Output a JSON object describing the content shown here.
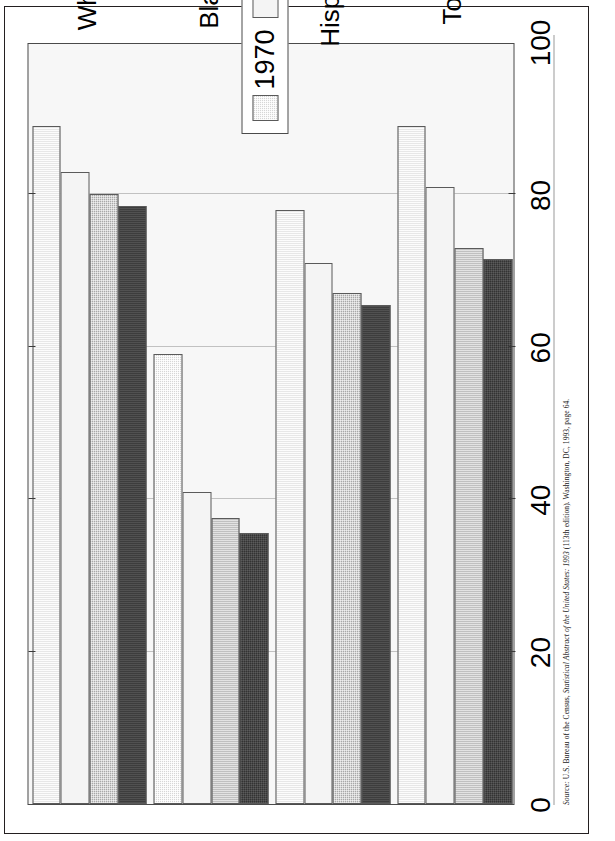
{
  "document": {
    "orientation": "rotated-90-ccw",
    "background_color": "#ffffff",
    "frame_color": "#231f20"
  },
  "caption": {
    "source_label": "Source:",
    "text": "U.S. Bureau of the Census, Statistical Abstract of the United States: 1993 (113th edition). Washington, DC, 1993, page 64.",
    "italic_part": "Statistical Abstract of the United States: 1993",
    "plain_head": "U.S. Bureau of the Census, ",
    "plain_tail": " (113th edition). Washington, DC, 1993, page 64."
  },
  "legend": {
    "position": "top-left-inside-plot",
    "entries": [
      {
        "label": "1970",
        "color": "#d6d6d6",
        "swatch": "stipple-light"
      },
      {
        "label": "1980",
        "color": "#f4f4f4",
        "swatch": "solid-white"
      },
      {
        "label": "1990",
        "color": "#a8a8a8",
        "swatch": "stipple-medium"
      },
      {
        "label": "1992",
        "color": "#333333",
        "swatch": "solid-dark"
      }
    ]
  },
  "chart_data": {
    "type": "bar",
    "orientation": "vertical-source-rendered-sideways",
    "title": "",
    "subtitle": "",
    "xlabel": "",
    "ylabel": "",
    "ylim": [
      0,
      100
    ],
    "grid": true,
    "grid_axis": "value",
    "legend_position": "top-left",
    "categories": [
      "White",
      "Black",
      "Hispanic",
      "Total"
    ],
    "tick_labels": [
      "0",
      "20",
      "40",
      "60",
      "80",
      "100"
    ],
    "tick_values": [
      0,
      20,
      40,
      60,
      80,
      100
    ],
    "series": [
      {
        "name": "1970",
        "color": "#d6d6d6",
        "values": [
          89,
          59,
          78,
          89
        ]
      },
      {
        "name": "1980",
        "color": "#f4f4f4",
        "values": [
          83,
          41,
          71,
          81
        ]
      },
      {
        "name": "1990",
        "color": "#a8a8a8",
        "values": [
          80,
          37.5,
          67,
          73
        ]
      },
      {
        "name": "1992",
        "color": "#333333",
        "values": [
          78.5,
          35.5,
          65.5,
          71.5
        ]
      }
    ]
  }
}
